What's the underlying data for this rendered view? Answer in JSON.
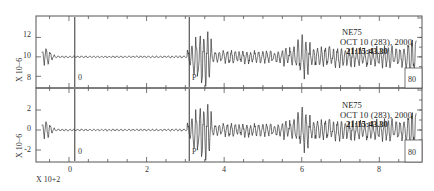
{
  "chart_data": {
    "type": "line",
    "title": "",
    "xlabel": "X 10+2",
    "x_ticks": [
      0,
      2,
      4,
      6,
      8
    ],
    "xlim": [
      -0.85,
      9.1
    ],
    "panels": [
      {
        "name": "top",
        "ylabel": "X 10−6",
        "y_ticks": [
          8,
          10,
          12
        ],
        "ylim": [
          6.8,
          14.2
        ],
        "baseline": 10,
        "station": "NE75",
        "date_line": "OCT 10 (283), 2000",
        "time_line": "21:15:43.30",
        "markers": [
          {
            "label": "0",
            "x": 0.15
          },
          {
            "label": "P",
            "x": 3.1
          }
        ],
        "end_label": "80"
      },
      {
        "name": "bottom",
        "ylabel": "X 10−6",
        "y_ticks": [
          -2,
          0,
          2
        ],
        "ylim": [
          -3.2,
          4.2
        ],
        "baseline": 0,
        "station": "NE75",
        "date_line": "OCT 10 (283), 2000",
        "time_line": "21:15:43.30",
        "markers": [
          {
            "label": "0",
            "x": 0.15
          },
          {
            "label": "P",
            "x": 3.1
          }
        ],
        "end_label": "80"
      }
    ],
    "series_description": "Seismogram waveform: small initial pulse near x=-0.6, low-amplitude noise until P arrival at x~3.1, large oscillations peaking near x~3.5, sustained moderate-to-large amplitude oscillations to x~9, spikes near x~6 and x~8.9",
    "grid": false,
    "legend": "none"
  },
  "labels": {
    "x_multiplier": "X 10+2",
    "y_multiplier": "X 10−6",
    "x_ticks": [
      "0",
      "2",
      "4",
      "6",
      "8"
    ],
    "top_y_ticks": [
      "8",
      "10",
      "12"
    ],
    "bottom_y_ticks": [
      "-2",
      "0",
      "2"
    ],
    "station": "NE75",
    "date_line": "OCT 10 (283), 2000",
    "time_line": "21:15:43.30",
    "origin_marker": "0",
    "p_marker": "P",
    "end_label": "80"
  }
}
